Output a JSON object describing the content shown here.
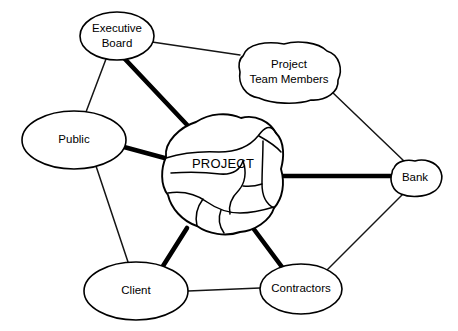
{
  "diagram": {
    "type": "stakeholder-network-diagram",
    "title": "",
    "background_color": "#ffffff",
    "line_color": "#000000",
    "canvas": {
      "width": 458,
      "height": 331
    },
    "nodes": [
      {
        "id": "executive-board",
        "label_lines": [
          "Executive",
          "Board"
        ],
        "label": "Executive Board",
        "shape": "ellipse",
        "cx": 117,
        "cy": 36,
        "rx": 37,
        "ry": 24
      },
      {
        "id": "project-team-members",
        "label_lines": [
          "Project",
          "Team Members"
        ],
        "label": "Project Team Members",
        "shape": "blob",
        "cx": 289,
        "cy": 73,
        "rx": 52,
        "ry": 28
      },
      {
        "id": "public",
        "label_lines": [
          "Public"
        ],
        "label": "Public",
        "shape": "ellipse",
        "cx": 74,
        "cy": 140,
        "rx": 52,
        "ry": 29
      },
      {
        "id": "project",
        "label_lines": [
          "PROJECT"
        ],
        "label": "PROJECT",
        "shape": "project-blob",
        "cx": 222,
        "cy": 175,
        "rx": 61,
        "ry": 58
      },
      {
        "id": "bank",
        "label_lines": [
          "Bank"
        ],
        "label": "Bank",
        "shape": "blob",
        "cx": 415,
        "cy": 178,
        "rx": 26,
        "ry": 17
      },
      {
        "id": "client",
        "label_lines": [
          "Client"
        ],
        "label": "Client",
        "shape": "ellipse",
        "cx": 136,
        "cy": 291,
        "rx": 52,
        "ry": 29
      },
      {
        "id": "contractors",
        "label_lines": [
          "Contractors"
        ],
        "label": "Contractors",
        "shape": "ellipse",
        "cx": 301,
        "cy": 289,
        "rx": 41,
        "ry": 25
      }
    ],
    "links": [
      {
        "from": "executive-board",
        "to": "project-team-members",
        "weight": "thin"
      },
      {
        "from": "executive-board",
        "to": "public",
        "weight": "thin"
      },
      {
        "from": "executive-board",
        "to": "project",
        "weight": "thick"
      },
      {
        "from": "project-team-members",
        "to": "bank",
        "weight": "thin"
      },
      {
        "from": "public",
        "to": "project",
        "weight": "thick"
      },
      {
        "from": "public",
        "to": "client",
        "weight": "thin"
      },
      {
        "from": "project",
        "to": "bank",
        "weight": "thick"
      },
      {
        "from": "project",
        "to": "client",
        "weight": "thick"
      },
      {
        "from": "project",
        "to": "contractors",
        "weight": "thick"
      },
      {
        "from": "bank",
        "to": "contractors",
        "weight": "thin"
      },
      {
        "from": "client",
        "to": "contractors",
        "weight": "thin"
      }
    ]
  }
}
